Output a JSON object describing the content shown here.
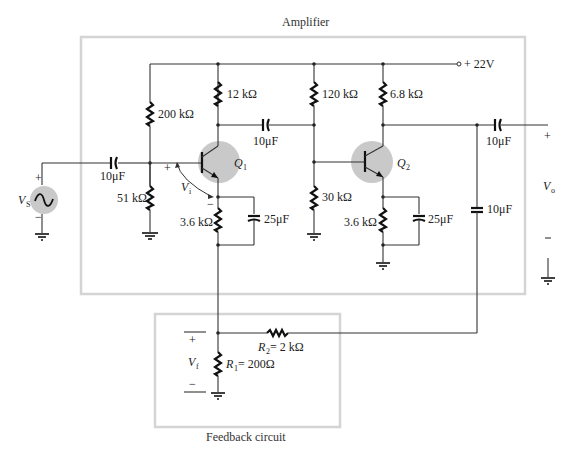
{
  "diagram": {
    "type": "circuit-schematic",
    "amplifier_block": {
      "title": "Amplifier",
      "supply": "+ 22V",
      "components": {
        "r_bias_top_q1": "200 kΩ",
        "r_bias_bottom_q1": "51 kΩ",
        "r_collector_q1": "12 kΩ",
        "r_emitter_q1": "3.6 kΩ",
        "c_emitter_q1": "25μF",
        "c_input": "10μF",
        "c_coupling": "10μF",
        "r_bias_top_q2": "120 kΩ",
        "r_bias_bottom_q2": "30 kΩ",
        "r_collector_q2": "6.8 kΩ",
        "r_emitter_q2": "3.6 kΩ",
        "c_emitter_q2": "25μF",
        "c_output": "10μF",
        "c_feedback": "10μF"
      },
      "transistors": [
        {
          "label": "Q",
          "sub": "1"
        },
        {
          "label": "Q",
          "sub": "2"
        }
      ],
      "input_voltage": {
        "label": "V",
        "sub": "i",
        "plus": "+",
        "minus": "−"
      },
      "source": {
        "label": "V",
        "sub": "S",
        "plus": "+",
        "minus": "−"
      },
      "output_voltage": {
        "label": "V",
        "sub": "o",
        "plus": "+",
        "minus": "−"
      }
    },
    "feedback_block": {
      "title": "Feedback circuit",
      "r1": {
        "label": "R",
        "sub": "1",
        "value": " = 200Ω"
      },
      "r2": {
        "label": "R",
        "sub": "2",
        "value": " = 2 kΩ"
      },
      "feedback_voltage": {
        "label": "V",
        "sub": "f",
        "plus": "+",
        "minus": "−"
      }
    },
    "colors": {
      "wire": "#333333",
      "box_border": "#d4d4d4",
      "transistor_halo": "#c9c9c9"
    }
  }
}
